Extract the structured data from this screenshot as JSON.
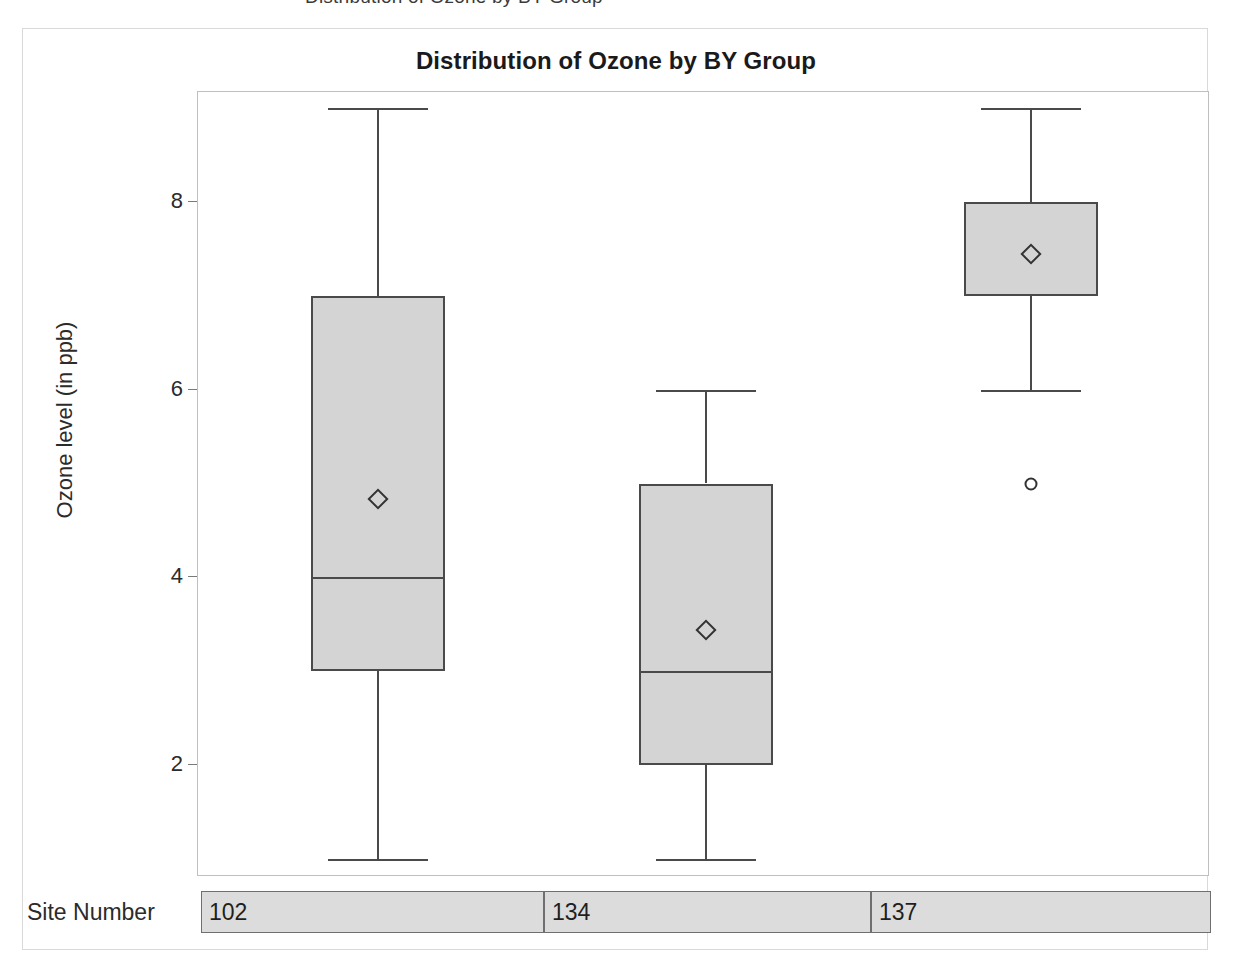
{
  "clipped_header_text": "Distribution of Ozone by BY Group",
  "title": "Distribution of Ozone by BY Group",
  "axes": {
    "y_title": "Ozone level (in ppb)",
    "y_ticks": [
      "2",
      "4",
      "6",
      "8"
    ],
    "category_row_label": "Site Number"
  },
  "categories": [
    {
      "label": "102"
    },
    {
      "label": "134"
    },
    {
      "label": "137"
    }
  ],
  "colors": {
    "box_fill": "#d4d4d4",
    "box_outline": "#4a4a4a",
    "wall_border": "#bfbfbf",
    "figure_border": "#d9d9d9",
    "text": "#2b2b2b",
    "band_fill": "#dcdcdc",
    "band_border": "#6f6f6f"
  },
  "chart_data": {
    "type": "box",
    "title": "Distribution of Ozone by BY Group",
    "xlabel": "Site Number",
    "ylabel": "Ozone level (in ppb)",
    "ylim": [
      0.6,
      9.3
    ],
    "yticks": [
      2,
      4,
      6,
      8
    ],
    "grid": false,
    "legend": "none",
    "categories": [
      "102",
      "134",
      "137"
    ],
    "boxes": [
      {
        "category": "102",
        "whisker_low": 1,
        "q1": 3,
        "median": 4,
        "q3": 7,
        "whisker_high": 9,
        "mean": 4.83,
        "outliers": []
      },
      {
        "category": "134",
        "whisker_low": 1,
        "q1": 2,
        "median": 3,
        "q3": 5,
        "whisker_high": 6,
        "mean": 3.44,
        "outliers": []
      },
      {
        "category": "137",
        "whisker_low": 6,
        "q1": 7,
        "median": 8,
        "q3": 8,
        "whisker_high": 9,
        "mean": 7.45,
        "outliers": [
          5
        ]
      }
    ]
  }
}
